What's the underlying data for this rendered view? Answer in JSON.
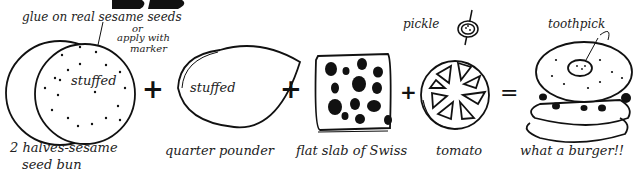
{
  "title_fragment": "BB",
  "annotations": {
    "sesame_note_line1": "glue on real sesame seeds",
    "sesame_note_or": "or",
    "sesame_note_line2": "apply with",
    "sesame_note_line3": "marker",
    "pickle": "pickle",
    "toothpick": "toothpick"
  },
  "equation": {
    "items": [
      {
        "id": "bun",
        "inner_text": "stuffed",
        "label_line1": "2 halves-sesame",
        "label_line2": "seed bun"
      },
      {
        "id": "patty",
        "inner_text": "stuffed",
        "label_line1": "quarter pounder"
      },
      {
        "id": "cheese",
        "label_line1": "flat slab of Swiss"
      },
      {
        "id": "tomato",
        "label_line1": "tomato"
      },
      {
        "id": "burger",
        "label_line1": "what a burger!!"
      }
    ],
    "operators": [
      "+",
      "+",
      "+",
      "="
    ]
  },
  "colors": {
    "ink": "#1a1a1a",
    "paper": "#ffffff"
  }
}
